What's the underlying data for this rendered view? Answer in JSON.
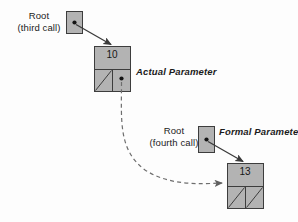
{
  "diagram": {
    "colors": {
      "node_fill": "#b3b3b3",
      "node_stroke": "#3d3d3d",
      "arrow": "#3a3a3a",
      "dashed_arrow": "#6e6e6e",
      "text": "#1b1b1b",
      "background": "#fdfdfd"
    },
    "labels": {
      "root_third_line1": "Root",
      "root_third_line2": "(third call)",
      "root_fourth_line1": "Root",
      "root_fourth_line2": "(fourth call)",
      "actual_parameter": "Actual Parameter",
      "formal_parameter": "Formal Parameter"
    },
    "nodes": [
      {
        "id": "node-10",
        "value": "10",
        "left_child": "null",
        "right_child": "pointer"
      },
      {
        "id": "node-13",
        "value": "13",
        "left_child": "null",
        "right_child": "null"
      }
    ],
    "pointer_boxes": [
      {
        "id": "root-pointer-third-call",
        "marker": "dot"
      },
      {
        "id": "root-pointer-fourth-call",
        "marker": "dot"
      }
    ],
    "edges": [
      {
        "id": "edge-root3-to-node10",
        "style": "solid",
        "from": "root-pointer-third-call",
        "to": "node-10"
      },
      {
        "id": "edge-node10-to-node13",
        "style": "dashed",
        "from": "node-10-right-pointer",
        "to": "node-13"
      },
      {
        "id": "edge-root4-to-node13",
        "style": "solid",
        "from": "root-pointer-fourth-call",
        "to": "node-13"
      }
    ]
  }
}
